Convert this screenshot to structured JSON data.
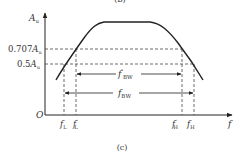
{
  "figure": {
    "top_label_partial": "(b)",
    "caption": "(c)",
    "axes": {
      "y_label": "A",
      "y_label_sub": "u",
      "x_label": "f",
      "origin": "O"
    },
    "levels": [
      {
        "coef": "0.707",
        "sym": "A",
        "sub": "u"
      },
      {
        "coef": "0.5",
        "sym": "A",
        "sub": "u"
      }
    ],
    "freqs": [
      {
        "sym": "f",
        "sub": "L",
        "prime": ""
      },
      {
        "sym": "f",
        "sub": "L",
        "prime": "′"
      },
      {
        "sym": "f",
        "sub": "H",
        "prime": "′"
      },
      {
        "sym": "f",
        "sub": "H",
        "prime": ""
      }
    ],
    "bandwidths": [
      {
        "sym": "f",
        "prime": "′",
        "sub": "BW"
      },
      {
        "sym": "f",
        "prime": "",
        "sub": "BW"
      }
    ]
  }
}
